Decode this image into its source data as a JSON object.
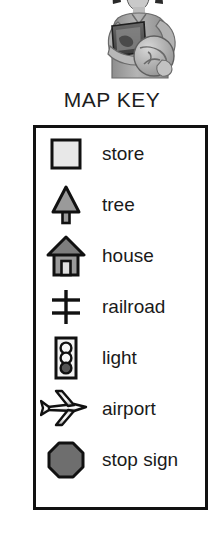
{
  "illustration": {
    "name": "student-holding-book-and-globe",
    "description": "Grayscale clip-art of a child holding a book and a globe"
  },
  "title": "MAP KEY",
  "legend": {
    "items": [
      {
        "icon": "store-square-icon",
        "label": "store"
      },
      {
        "icon": "tree-icon",
        "label": "tree"
      },
      {
        "icon": "house-icon",
        "label": "house"
      },
      {
        "icon": "railroad-crossing-icon",
        "label": "railroad"
      },
      {
        "icon": "traffic-light-icon",
        "label": "light"
      },
      {
        "icon": "airplane-icon",
        "label": "airport"
      },
      {
        "icon": "stop-sign-octagon-icon",
        "label": "stop sign"
      }
    ]
  },
  "colors": {
    "outline": "#111111",
    "store_fill": "#e8e8e8",
    "tree_fill": "#9a9a9a",
    "house_roof": "#7d7d7d",
    "house_wall": "#9a9a9a",
    "house_door": "#e0e0e0",
    "light_body": "#f2f2f2",
    "light_lens_off": "#f5f5f5",
    "light_lens_on": "#555555",
    "plane_fill": "#b8b8b8",
    "stop_fill": "#6e6e6e",
    "background": "#ffffff"
  }
}
